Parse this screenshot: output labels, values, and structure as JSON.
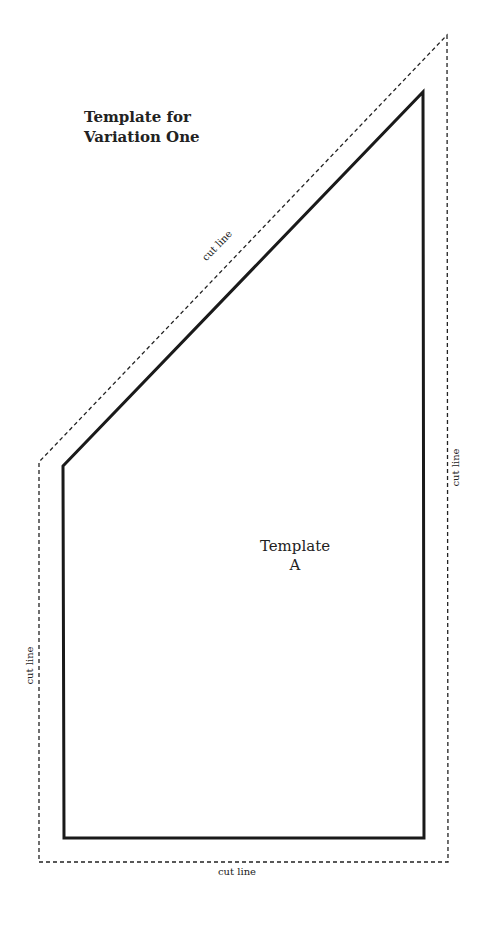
{
  "title": {
    "line1": "Template for",
    "line2": "Variation One"
  },
  "template_label": {
    "line1": "Template",
    "line2": "A"
  },
  "cut_labels": {
    "diagonal": "cut line",
    "right": "cut line",
    "left": "cut line",
    "bottom": "cut line"
  },
  "colors": {
    "line": "#1a1a1a",
    "background": "#ffffff"
  },
  "shapes": {
    "cut_outline": "447,35 448,862 39,862 39,462",
    "template_outline": "63,466 423,92 424,838 64,838"
  }
}
